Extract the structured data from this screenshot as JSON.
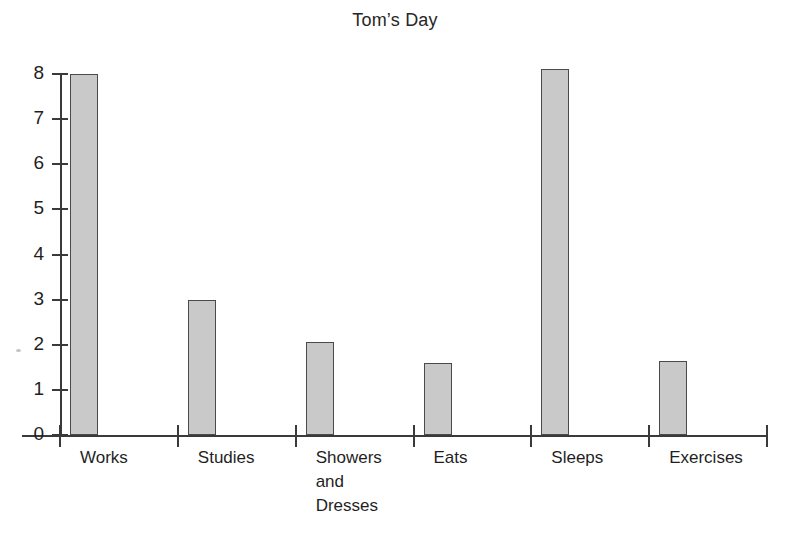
{
  "chart_data": {
    "type": "bar",
    "title": "Tom’s Day",
    "xlabel": "",
    "ylabel": "",
    "categories": [
      "Works",
      "Studies",
      "Showers\nand\nDresses",
      "Eats",
      "Sleeps",
      "Exercises"
    ],
    "values": [
      8.0,
      3.0,
      2.05,
      1.6,
      8.1,
      1.65
    ],
    "ylim": [
      0,
      8
    ],
    "yticks": [
      0,
      1,
      2,
      3,
      4,
      5,
      6,
      7,
      8
    ],
    "ytick_labels": [
      "0",
      "1",
      "2",
      "3",
      "4",
      "5",
      "6",
      "7",
      "8"
    ],
    "grid": false,
    "legend": null,
    "bar_color": "#c9c9c9",
    "bar_edge_color": "#4a4a4a",
    "axis_color": "#3a3a3a",
    "background_color": "#ffffff",
    "text_color": "#1f1f1f"
  }
}
